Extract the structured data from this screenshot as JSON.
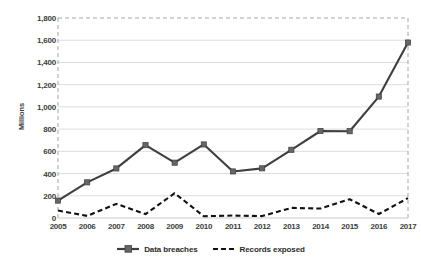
{
  "chart_data": {
    "type": "line",
    "title": "",
    "subtitle": "",
    "xlabel": "",
    "ylabel": "Millions",
    "categories": [
      "2005",
      "2006",
      "2007",
      "2008",
      "2009",
      "2010",
      "2011",
      "2012",
      "2013",
      "2014",
      "2015",
      "2016",
      "2017"
    ],
    "x": [
      2005,
      2006,
      2007,
      2008,
      2009,
      2010,
      2011,
      2012,
      2013,
      2014,
      2015,
      2016,
      2017
    ],
    "ylim": [
      0,
      1800
    ],
    "ytick_labels": [
      "0",
      "200",
      "400",
      "600",
      "800",
      "1,000",
      "1,200",
      "1,400",
      "1,600",
      "1,800"
    ],
    "ytick_values": [
      0,
      200,
      400,
      600,
      800,
      1000,
      1200,
      1400,
      1600,
      1800
    ],
    "grid": true,
    "grid_axis": "y",
    "legend_position": "bottom",
    "series": [
      {
        "name": "Data breaches",
        "style": "solid-with-square-markers",
        "color": "#3f3f3f",
        "marker_color": "#666666",
        "values": [
          157,
          321,
          446,
          656,
          498,
          662,
          419,
          447,
          614,
          783,
          781,
          1093,
          1579
        ]
      },
      {
        "name": "Records exposed",
        "style": "dashed",
        "color": "#111111",
        "marker_color": "",
        "values": [
          67,
          19,
          127,
          35,
          223,
          16,
          22,
          17,
          91,
          85,
          169,
          36,
          179
        ]
      }
    ]
  },
  "legend": {
    "items": [
      {
        "label": "Data breaches"
      },
      {
        "label": "Records exposed"
      }
    ]
  },
  "colors": {
    "grid": "#d4d4d4",
    "border": "#9a9a9a",
    "text": "#3d3d3d",
    "series_1": "#3f3f3f",
    "series_2": "#111111",
    "marker": "#666666",
    "background": "#ffffff"
  }
}
